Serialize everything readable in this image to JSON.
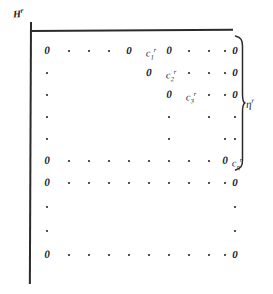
{
  "figure": {
    "kind": "handwritten-matrix-diagram",
    "axis_label": {
      "base": "H",
      "sup": "r"
    },
    "brace_label": {
      "base": "η",
      "sup": "r"
    },
    "glyphs": {
      "zero": "0",
      "c": "c"
    },
    "rows": [
      {
        "index": 1,
        "cells": [
          {
            "t": "zero",
            "v": "0"
          },
          {
            "t": "dot"
          },
          {
            "t": "dot"
          },
          {
            "t": "dot"
          },
          {
            "t": "zero",
            "v": "0"
          },
          {
            "t": "clab",
            "base": "c",
            "sub": "1",
            "sup": "r"
          },
          {
            "t": "zero",
            "v": "0"
          },
          {
            "t": "dot"
          },
          {
            "t": "dot"
          },
          {
            "t": "dot"
          },
          {
            "t": "zero",
            "v": "0"
          }
        ]
      },
      {
        "index": 2,
        "cells": [
          {
            "t": "dot"
          },
          {
            "t": "empty"
          },
          {
            "t": "empty"
          },
          {
            "t": "empty"
          },
          {
            "t": "empty"
          },
          {
            "t": "zero",
            "v": "0"
          },
          {
            "t": "clab",
            "base": "c",
            "sub": "2",
            "sup": "r"
          },
          {
            "t": "dot"
          },
          {
            "t": "dot"
          },
          {
            "t": "dot"
          },
          {
            "t": "zero",
            "v": "0"
          }
        ]
      },
      {
        "index": 3,
        "cells": [
          {
            "t": "dot"
          },
          {
            "t": "empty"
          },
          {
            "t": "empty"
          },
          {
            "t": "empty"
          },
          {
            "t": "empty"
          },
          {
            "t": "empty"
          },
          {
            "t": "zero",
            "v": "0"
          },
          {
            "t": "clab",
            "base": "c",
            "sub": "3",
            "sup": "r"
          },
          {
            "t": "dot"
          },
          {
            "t": "dot"
          },
          {
            "t": "zero",
            "v": "0"
          }
        ]
      },
      {
        "index": 4,
        "cells": [
          {
            "t": "dot"
          },
          {
            "t": "empty"
          },
          {
            "t": "empty"
          },
          {
            "t": "empty"
          },
          {
            "t": "empty"
          },
          {
            "t": "empty"
          },
          {
            "t": "dot"
          },
          {
            "t": "empty"
          },
          {
            "t": "dot"
          },
          {
            "t": "empty"
          },
          {
            "t": "dot"
          }
        ]
      },
      {
        "index": 5,
        "cells": [
          {
            "t": "dot"
          },
          {
            "t": "empty"
          },
          {
            "t": "empty"
          },
          {
            "t": "empty"
          },
          {
            "t": "empty"
          },
          {
            "t": "empty"
          },
          {
            "t": "dot"
          },
          {
            "t": "empty"
          },
          {
            "t": "empty"
          },
          {
            "t": "dot"
          },
          {
            "t": "dot"
          }
        ]
      },
      {
        "index": 6,
        "cells": [
          {
            "t": "zero",
            "v": "0"
          },
          {
            "t": "dot"
          },
          {
            "t": "dot"
          },
          {
            "t": "dot"
          },
          {
            "t": "dot"
          },
          {
            "t": "dot"
          },
          {
            "t": "dot"
          },
          {
            "t": "dot"
          },
          {
            "t": "dot"
          },
          {
            "t": "zero",
            "v": "0"
          },
          {
            "t": "clab",
            "base": "c",
            "sub": "η",
            "sup": "r"
          }
        ]
      },
      {
        "index": 7,
        "cells": [
          {
            "t": "zero",
            "v": "0"
          },
          {
            "t": "dot"
          },
          {
            "t": "dot"
          },
          {
            "t": "dot"
          },
          {
            "t": "dot"
          },
          {
            "t": "dot"
          },
          {
            "t": "dot"
          },
          {
            "t": "dot"
          },
          {
            "t": "dot"
          },
          {
            "t": "dot"
          },
          {
            "t": "zero",
            "v": "0"
          }
        ]
      },
      {
        "index": 8,
        "cells": [
          {
            "t": "dot"
          },
          {
            "t": "empty"
          },
          {
            "t": "empty"
          },
          {
            "t": "empty"
          },
          {
            "t": "empty"
          },
          {
            "t": "empty"
          },
          {
            "t": "empty"
          },
          {
            "t": "empty"
          },
          {
            "t": "empty"
          },
          {
            "t": "empty"
          },
          {
            "t": "dot"
          }
        ]
      },
      {
        "index": 9,
        "cells": [
          {
            "t": "dot"
          },
          {
            "t": "empty"
          },
          {
            "t": "empty"
          },
          {
            "t": "empty"
          },
          {
            "t": "empty"
          },
          {
            "t": "empty"
          },
          {
            "t": "empty"
          },
          {
            "t": "empty"
          },
          {
            "t": "empty"
          },
          {
            "t": "empty"
          },
          {
            "t": "dot"
          }
        ]
      },
      {
        "index": 10,
        "cells": [
          {
            "t": "zero",
            "v": "0"
          },
          {
            "t": "dot"
          },
          {
            "t": "dot"
          },
          {
            "t": "dot"
          },
          {
            "t": "dot"
          },
          {
            "t": "dot"
          },
          {
            "t": "dot"
          },
          {
            "t": "dot"
          },
          {
            "t": "dot"
          },
          {
            "t": "dot"
          },
          {
            "t": "zero",
            "v": "0"
          }
        ]
      }
    ]
  }
}
